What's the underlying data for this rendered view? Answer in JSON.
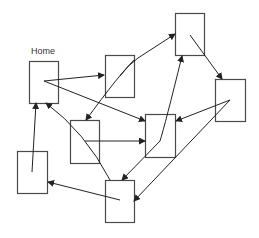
{
  "diagram": {
    "title": "",
    "colors": {
      "stroke": "#4a4a4a",
      "arrow": "#222222",
      "background": "#ffffff"
    },
    "nodes": [
      {
        "id": "home",
        "label": "Home",
        "x": 29,
        "y": 61,
        "w": 29,
        "h": 42
      },
      {
        "id": "b",
        "label": "",
        "x": 105,
        "y": 55,
        "w": 29,
        "h": 42
      },
      {
        "id": "c",
        "label": "",
        "x": 175,
        "y": 13,
        "w": 29,
        "h": 42
      },
      {
        "id": "d",
        "label": "",
        "x": 215,
        "y": 79,
        "w": 30,
        "h": 42
      },
      {
        "id": "e",
        "label": "",
        "x": 145,
        "y": 114,
        "w": 30,
        "h": 43
      },
      {
        "id": "f",
        "label": "",
        "x": 70,
        "y": 120,
        "w": 29,
        "h": 43
      },
      {
        "id": "g",
        "label": "",
        "x": 17,
        "y": 151,
        "w": 30,
        "h": 42
      },
      {
        "id": "h",
        "label": "",
        "x": 105,
        "y": 180,
        "w": 29,
        "h": 42
      }
    ],
    "edges": [
      {
        "from": "home",
        "to": "b",
        "path": "M44,81 L104,75"
      },
      {
        "from": "home",
        "to": "e",
        "path": "M44,81 L145,121"
      },
      {
        "from": "b",
        "to": "c",
        "path": "M120,76 Q128,65 138,58 L175,34"
      },
      {
        "from": "b",
        "to": "f",
        "path": "M134,60 Q118,76 86,120"
      },
      {
        "from": "c",
        "to": "d",
        "path": "M190,35 L222,79"
      },
      {
        "from": "d",
        "to": "e",
        "path": "M230,100 L176,121"
      },
      {
        "from": "d",
        "to": "h",
        "path": "M230,100 L134,201"
      },
      {
        "from": "e",
        "to": "c",
        "path": "M160,141 Q165,125 182,56"
      },
      {
        "from": "e",
        "to": "h",
        "path": "M160,141 L122,180"
      },
      {
        "from": "f",
        "to": "e",
        "path": "M85,141 L145,141"
      },
      {
        "from": "h",
        "to": "home",
        "path": "M110,180 Q85,132 46,103"
      },
      {
        "from": "g",
        "to": "home",
        "path": "M32,172 L36,103"
      },
      {
        "from": "h",
        "to": "g",
        "path": "M120,200 L48,182"
      }
    ]
  }
}
